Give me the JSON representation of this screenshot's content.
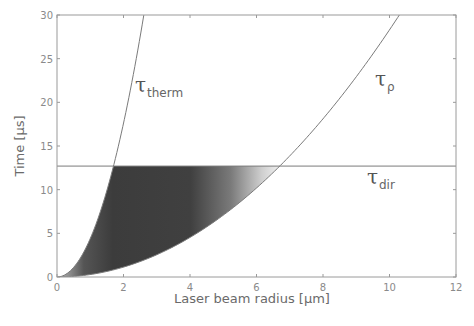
{
  "chart_data": {
    "type": "line",
    "title": "",
    "xlabel": "Laser beam radius [µm]",
    "ylabel": "Time [µs]",
    "xlim": [
      0,
      12
    ],
    "ylim": [
      0,
      30
    ],
    "xticks": [
      0,
      2,
      4,
      6,
      8,
      10,
      12
    ],
    "yticks": [
      0,
      5,
      10,
      15,
      20,
      25,
      30
    ],
    "grid": false,
    "legend": "inline labels",
    "series": [
      {
        "name": "τ_therm",
        "label_main": "τ",
        "label_sub": "therm",
        "x": [
          0,
          0.5,
          1.0,
          1.5,
          1.7,
          2.0,
          2.3,
          2.6
        ],
        "y": [
          0,
          1.1,
          4.4,
          9.9,
          12.7,
          17.6,
          23.3,
          29.7
        ]
      },
      {
        "name": "τ_ρ",
        "label_main": "τ",
        "label_sub": "ρ",
        "x": [
          0,
          1,
          2,
          3,
          4,
          5,
          6,
          6.7,
          7,
          8,
          9,
          10,
          10.4
        ],
        "y": [
          0,
          0.28,
          1.13,
          2.55,
          4.5,
          7.1,
          10.2,
          12.7,
          13.9,
          18.1,
          22.9,
          28.3,
          30.0
        ]
      },
      {
        "name": "τ_dir",
        "label_main": "τ",
        "label_sub": "dir",
        "x": [
          0,
          12
        ],
        "y": [
          12.7,
          12.7
        ]
      }
    ],
    "annotations": [
      {
        "type": "shaded-region",
        "description": "Region between τ_therm and τ_ρ below τ_dir, dark gray fading to light toward right",
        "x_range": [
          0,
          6.7
        ],
        "y_range": [
          0,
          12.7
        ]
      }
    ]
  },
  "axes": {
    "xlabel": "Laser beam radius [µm]",
    "ylabel": "Time [µs]",
    "xtick_labels": [
      "0",
      "2",
      "4",
      "6",
      "8",
      "10",
      "12"
    ],
    "ytick_labels": [
      "0",
      "5",
      "10",
      "15",
      "20",
      "25",
      "30"
    ]
  },
  "labels": {
    "therm_main": "τ",
    "therm_sub": "therm",
    "rho_main": "τ",
    "rho_sub": "ρ",
    "dir_main": "τ",
    "dir_sub": "dir"
  },
  "colors": {
    "axis": "#9a9a9a",
    "curve": "#7a7a7a",
    "shade_dark": "#3a3a3a",
    "shade_light": "#e0e0e0"
  }
}
